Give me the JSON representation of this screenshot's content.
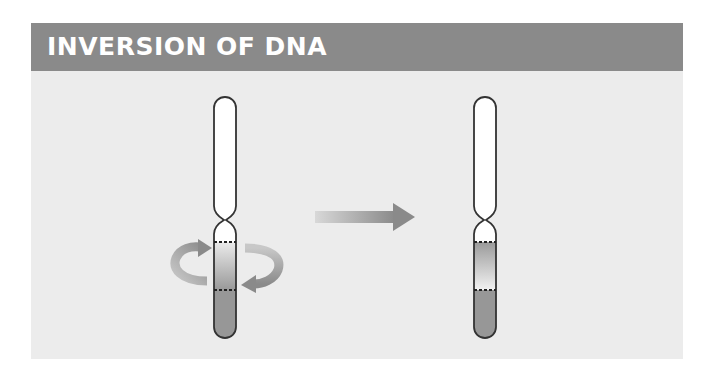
{
  "header": {
    "title": "INVERSION OF DNA"
  },
  "diagram": {
    "before": {
      "label": "original-chromosome",
      "segment_gradient": "light-top-to-dark-bottom"
    },
    "after": {
      "label": "inverted-chromosome",
      "segment_gradient": "dark-top-to-light-bottom"
    },
    "arrow": "transition-arrow",
    "colors": {
      "banner": "#8a8a8a",
      "panel": "#ececec",
      "chromosome_outline": "#333333",
      "segment_dark": "#8f8f8f",
      "segment_light": "#e6e6e6",
      "arrow": "#8c8c8c"
    }
  }
}
